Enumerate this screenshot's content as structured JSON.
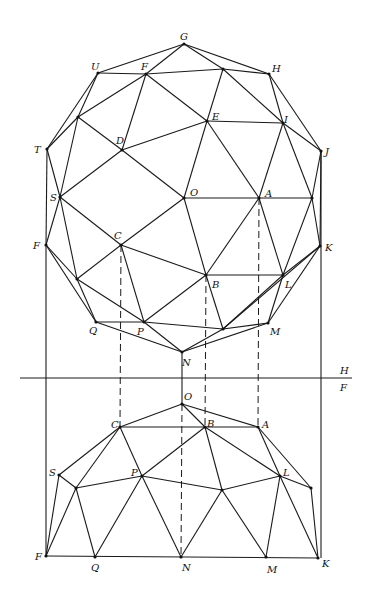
{
  "fold_line": {
    "upper_label": "H",
    "lower_label": "F",
    "y": 378,
    "x1": 20,
    "x2": 352
  },
  "plan": {
    "points": {
      "G": [
        184,
        44
      ],
      "U": [
        98,
        73
      ],
      "F": [
        146,
        74
      ],
      "X1": [
        223,
        69
      ],
      "H": [
        269,
        74
      ],
      "X2": [
        78,
        117
      ],
      "E": [
        207,
        121
      ],
      "I": [
        283,
        123
      ],
      "T": [
        47,
        149
      ],
      "D": [
        122,
        150
      ],
      "J": [
        321,
        151
      ],
      "S": [
        60,
        197
      ],
      "O": [
        184,
        198
      ],
      "A": [
        259,
        198
      ],
      "X3": [
        312,
        198
      ],
      "F2": [
        46,
        245
      ],
      "C": [
        121,
        245
      ],
      "K": [
        320,
        246
      ],
      "X4": [
        77,
        279
      ],
      "B": [
        206,
        275
      ],
      "L": [
        283,
        275
      ],
      "Q": [
        96,
        322
      ],
      "P": [
        144,
        322
      ],
      "X5": [
        223,
        329
      ],
      "M": [
        268,
        323
      ],
      "N": [
        182,
        352
      ]
    },
    "edges": [
      [
        "G",
        "U"
      ],
      [
        "G",
        "F"
      ],
      [
        "G",
        "X1"
      ],
      [
        "G",
        "H"
      ],
      [
        "U",
        "F"
      ],
      [
        "F",
        "X1"
      ],
      [
        "X1",
        "H"
      ],
      [
        "U",
        "X2"
      ],
      [
        "U",
        "T"
      ],
      [
        "F",
        "X2"
      ],
      [
        "F",
        "D"
      ],
      [
        "F",
        "E"
      ],
      [
        "X1",
        "E"
      ],
      [
        "X1",
        "I"
      ],
      [
        "H",
        "I"
      ],
      [
        "H",
        "J"
      ],
      [
        "T",
        "X2"
      ],
      [
        "X2",
        "D"
      ],
      [
        "D",
        "E"
      ],
      [
        "E",
        "I"
      ],
      [
        "I",
        "J"
      ],
      [
        "T",
        "S"
      ],
      [
        "X2",
        "S"
      ],
      [
        "S",
        "D"
      ],
      [
        "D",
        "O"
      ],
      [
        "E",
        "O"
      ],
      [
        "E",
        "A"
      ],
      [
        "I",
        "A"
      ],
      [
        "I",
        "X3"
      ],
      [
        "J",
        "X3"
      ],
      [
        "S",
        "C"
      ],
      [
        "O",
        "A"
      ],
      [
        "A",
        "X3"
      ],
      [
        "S",
        "F2"
      ],
      [
        "T",
        "F2"
      ],
      [
        "S",
        "X4"
      ],
      [
        "C",
        "O"
      ],
      [
        "C",
        "X4"
      ],
      [
        "C",
        "P"
      ],
      [
        "C",
        "B"
      ],
      [
        "O",
        "B"
      ],
      [
        "A",
        "B"
      ],
      [
        "A",
        "L"
      ],
      [
        "X3",
        "L"
      ],
      [
        "X3",
        "K"
      ],
      [
        "J",
        "K"
      ],
      [
        "F2",
        "X4"
      ],
      [
        "F2",
        "Q"
      ],
      [
        "X4",
        "Q"
      ],
      [
        "X4",
        "P"
      ],
      [
        "P",
        "B"
      ],
      [
        "B",
        "L"
      ],
      [
        "B",
        "X5"
      ],
      [
        "L",
        "X5"
      ],
      [
        "L",
        "K"
      ],
      [
        "L",
        "M"
      ],
      [
        "K",
        "M"
      ],
      [
        "K",
        "X5"
      ],
      [
        "Q",
        "P"
      ],
      [
        "P",
        "X5"
      ],
      [
        "X5",
        "M"
      ],
      [
        "Q",
        "N"
      ],
      [
        "P",
        "N"
      ],
      [
        "X5",
        "N"
      ],
      [
        "M",
        "N"
      ]
    ],
    "labels": [
      {
        "text": "G",
        "x": 180,
        "y": 32
      },
      {
        "text": "U",
        "x": 91,
        "y": 62
      },
      {
        "text": "F",
        "x": 141,
        "y": 62
      },
      {
        "text": "H",
        "x": 272,
        "y": 64
      },
      {
        "text": "E",
        "x": 212,
        "y": 112
      },
      {
        "text": "I",
        "x": 284,
        "y": 115
      },
      {
        "text": "D",
        "x": 116,
        "y": 136
      },
      {
        "text": "T",
        "x": 34,
        "y": 145
      },
      {
        "text": "J",
        "x": 325,
        "y": 147
      },
      {
        "text": "S",
        "x": 50,
        "y": 193
      },
      {
        "text": "O",
        "x": 190,
        "y": 188
      },
      {
        "text": "A",
        "x": 265,
        "y": 189
      },
      {
        "text": "C",
        "x": 114,
        "y": 231
      },
      {
        "text": "F",
        "x": 33,
        "y": 241
      },
      {
        "text": "K",
        "x": 325,
        "y": 243
      },
      {
        "text": "B",
        "x": 212,
        "y": 280
      },
      {
        "text": "L",
        "x": 285,
        "y": 280
      },
      {
        "text": "Q",
        "x": 89,
        "y": 326
      },
      {
        "text": "P",
        "x": 137,
        "y": 327
      },
      {
        "text": "M",
        "x": 270,
        "y": 327
      },
      {
        "text": "N",
        "x": 182,
        "y": 358
      }
    ]
  },
  "elevation": {
    "points": {
      "O": [
        182,
        404
      ],
      "C": [
        120,
        427
      ],
      "B": [
        205,
        427
      ],
      "A": [
        258,
        427
      ],
      "S": [
        59,
        475
      ],
      "P": [
        142,
        476
      ],
      "L": [
        280,
        476
      ],
      "X6": [
        76,
        488
      ],
      "X7": [
        222,
        490
      ],
      "X8": [
        311,
        488
      ],
      "F": [
        46,
        556
      ],
      "Q": [
        95,
        557
      ],
      "N": [
        181,
        557
      ],
      "M": [
        266,
        557
      ],
      "K": [
        318,
        558
      ]
    },
    "edges": [
      [
        "O",
        "C"
      ],
      [
        "O",
        "B"
      ],
      [
        "O",
        "A"
      ],
      [
        "C",
        "B"
      ],
      [
        "B",
        "A"
      ],
      [
        "C",
        "S"
      ],
      [
        "C",
        "X6"
      ],
      [
        "C",
        "P"
      ],
      [
        "B",
        "P"
      ],
      [
        "B",
        "X7"
      ],
      [
        "B",
        "L"
      ],
      [
        "A",
        "L"
      ],
      [
        "A",
        "X8"
      ],
      [
        "S",
        "X6"
      ],
      [
        "X6",
        "P"
      ],
      [
        "P",
        "X7"
      ],
      [
        "X7",
        "L"
      ],
      [
        "L",
        "X8"
      ],
      [
        "S",
        "F"
      ],
      [
        "X6",
        "F"
      ],
      [
        "X6",
        "Q"
      ],
      [
        "P",
        "Q"
      ],
      [
        "P",
        "N"
      ],
      [
        "X7",
        "N"
      ],
      [
        "X7",
        "M"
      ],
      [
        "L",
        "M"
      ],
      [
        "L",
        "K"
      ],
      [
        "X8",
        "K"
      ],
      [
        "F",
        "K"
      ]
    ],
    "labels": [
      {
        "text": "O",
        "x": 184,
        "y": 392
      },
      {
        "text": "C",
        "x": 111,
        "y": 420
      },
      {
        "text": "B",
        "x": 207,
        "y": 419
      },
      {
        "text": "A",
        "x": 262,
        "y": 420
      },
      {
        "text": "S",
        "x": 49,
        "y": 468
      },
      {
        "text": "P",
        "x": 131,
        "y": 468
      },
      {
        "text": "L",
        "x": 283,
        "y": 468
      },
      {
        "text": "F",
        "x": 35,
        "y": 552
      },
      {
        "text": "Q",
        "x": 91,
        "y": 563
      },
      {
        "text": "N",
        "x": 182,
        "y": 563
      },
      {
        "text": "M",
        "x": 267,
        "y": 565
      },
      {
        "text": "K",
        "x": 322,
        "y": 559
      }
    ]
  },
  "projectors": {
    "solid": [
      [
        46,
        245,
        46,
        556
      ],
      [
        321,
        151,
        321,
        558
      ],
      [
        182,
        352,
        182,
        404
      ]
    ],
    "dashed": [
      [
        121,
        245,
        120,
        427
      ],
      [
        206,
        275,
        205,
        427
      ],
      [
        259,
        198,
        258,
        427
      ],
      [
        182,
        404,
        181,
        557
      ]
    ]
  }
}
